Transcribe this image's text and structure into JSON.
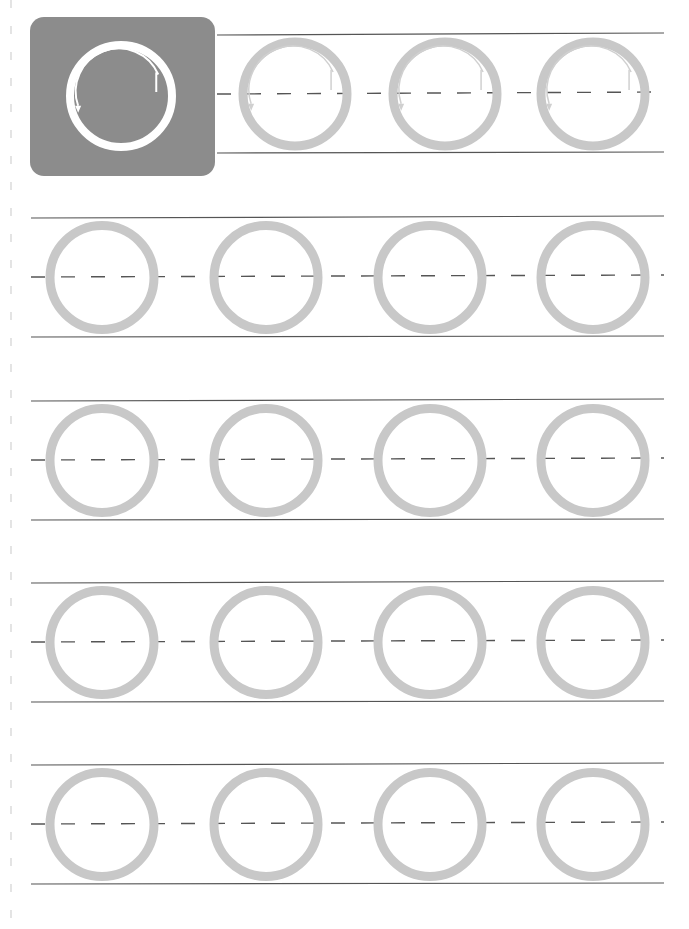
{
  "worksheet": {
    "title": "Letter O tracing practice",
    "letter": "O",
    "colors": {
      "background": "#ffffff",
      "example_tile": "#8c8c8c",
      "example_ring": "#ffffff",
      "trace_ring": "#c8c8c8",
      "guide_line": "#555555",
      "stroke_arrow": "#f2f2f2",
      "margin_dash": "#d8d8d8"
    },
    "example": {
      "x": 30,
      "y": 17,
      "w": 185,
      "h": 159,
      "radius": 14,
      "ring": {
        "cx": 121,
        "cy": 96,
        "r": 51,
        "stroke": 8
      },
      "hint": "start at top right, trace counter-clockwise"
    },
    "line_x_start": 31,
    "line_x_end": 664,
    "rows": [
      {
        "index": 1,
        "top": 35,
        "mid": 93,
        "bottom": 153,
        "mid_start": 217,
        "circles": [
          295,
          445,
          593
        ],
        "has_arrows": true
      },
      {
        "index": 2,
        "top": 218,
        "mid": 276,
        "bottom": 337,
        "mid_start": 31,
        "circles": [
          102,
          266,
          430,
          593
        ],
        "has_arrows": false
      },
      {
        "index": 3,
        "top": 401,
        "mid": 459,
        "bottom": 520,
        "mid_start": 31,
        "circles": [
          102,
          266,
          430,
          593
        ],
        "has_arrows": false
      },
      {
        "index": 4,
        "top": 583,
        "mid": 641,
        "bottom": 702,
        "mid_start": 31,
        "circles": [
          102,
          266,
          430,
          593
        ],
        "has_arrows": false
      },
      {
        "index": 5,
        "top": 765,
        "mid": 823,
        "bottom": 884,
        "mid_start": 31,
        "circles": [
          102,
          266,
          430,
          593
        ],
        "has_arrows": false
      }
    ],
    "circle_radius": 52,
    "circle_stroke": 9
  }
}
